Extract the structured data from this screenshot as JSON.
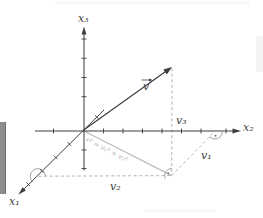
{
  "figure": {
    "axis_labels": {
      "x1": "x₁",
      "x2": "x₂",
      "x3": "x₃"
    },
    "vector_label": "v",
    "component_labels": {
      "v1": "v₁",
      "v2": "v₂",
      "v3": "v₃"
    },
    "equation": "r² = v₁² + v₂²",
    "colors": {
      "background": "#ffffff",
      "axis": "#3d3d3d",
      "label": "#3f3f3f",
      "dashed": "#a8a8a8",
      "projection": "#bcbcbc",
      "equation_text": "#b3b3b3",
      "sidebar_bar": "#8d8d8d"
    }
  }
}
